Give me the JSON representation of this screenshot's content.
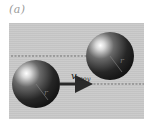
{
  "figure": {
    "panel_label": "(a)",
    "background_color": "#c9c9c9",
    "velocity": {
      "symbol": "v",
      "subscript": "moy"
    },
    "spheres": [
      {
        "id": "lower-left",
        "radius_label": "r"
      },
      {
        "id": "upper-right",
        "radius_label": "r"
      }
    ]
  }
}
